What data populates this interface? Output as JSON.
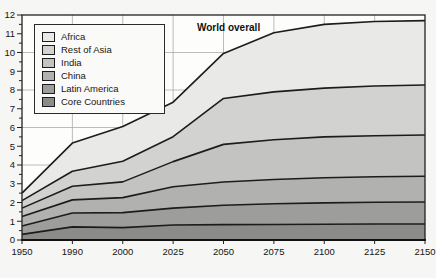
{
  "chart_data": {
    "type": "area",
    "stacked": true,
    "title": "",
    "annotation": "World overall",
    "x_labels": [
      "1950",
      "1990",
      "2000",
      "2025",
      "2050",
      "2075",
      "2100",
      "2125",
      "2150"
    ],
    "ylim": [
      0,
      12
    ],
    "y_major_tick_step": 1,
    "y_minor_tick_step": 0.5,
    "grid": {
      "vertical_at_each_x_tick": true,
      "horizontal_at_values": [
        2,
        4,
        6,
        8,
        10
      ],
      "color": "#ababab"
    },
    "legend_position": "top-left",
    "line_color": "#1c1c1c",
    "frame_color": "#222222",
    "series": [
      {
        "name": "Core Countries",
        "color": "#8b8b89",
        "values": [
          0.3,
          0.7,
          0.66,
          0.8,
          0.82,
          0.83,
          0.84,
          0.85,
          0.85
        ]
      },
      {
        "name": "Latin America",
        "color": "#9d9d9b",
        "values": [
          0.45,
          0.74,
          0.8,
          0.9,
          1.03,
          1.1,
          1.14,
          1.16,
          1.18
        ]
      },
      {
        "name": "China",
        "color": "#b1b1af",
        "values": [
          0.5,
          0.7,
          0.8,
          1.14,
          1.24,
          1.3,
          1.34,
          1.36,
          1.37
        ]
      },
      {
        "name": "India",
        "color": "#c3c3c1",
        "values": [
          0.45,
          0.73,
          0.84,
          1.34,
          2.01,
          2.12,
          2.18,
          2.19,
          2.2
        ]
      },
      {
        "name": "Rest of Asia",
        "color": "#d2d2d0",
        "values": [
          0.4,
          0.8,
          1.1,
          1.33,
          2.45,
          2.55,
          2.6,
          2.65,
          2.67
        ]
      },
      {
        "name": "Africa",
        "color": "#e9e9e7",
        "values": [
          0.4,
          1.5,
          1.85,
          1.84,
          2.4,
          3.15,
          3.4,
          3.44,
          3.43
        ]
      }
    ],
    "world_totals": [
      2.5,
      5.17,
      6.05,
      7.35,
      9.95,
      11.05,
      11.5,
      11.65,
      11.7
    ]
  },
  "legend": {
    "items": [
      "Africa",
      "Rest of Asia",
      "India",
      "China",
      "Latin America",
      "Core Countries"
    ]
  }
}
